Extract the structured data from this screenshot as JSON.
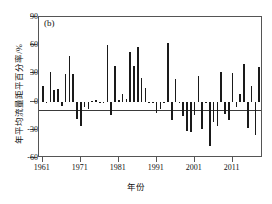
{
  "figure": {
    "panel_label": "(b)",
    "background": "#ffffff",
    "bar_color": "#1a1a1a",
    "axis_color": "#555555"
  },
  "chart_data": {
    "type": "bar",
    "title": "(b)",
    "xlabel": "年份",
    "ylabel": "年平均流量距平百分率/%",
    "ylim": [
      -60,
      90
    ],
    "xlim": [
      1960,
      2019
    ],
    "yticks": [
      90,
      60,
      30,
      0,
      -30,
      -60
    ],
    "ytick_labels": [
      "90",
      "60",
      "30",
      "0",
      "-30",
      "-60"
    ],
    "xticks": [
      1961,
      1971,
      1981,
      1991,
      2001,
      2011
    ],
    "xtick_labels": [
      "1961",
      "1971",
      "1981",
      "1991",
      "2001",
      "2011"
    ],
    "grid": false,
    "legend": null,
    "zero_reference_line": 0,
    "x": [
      1961,
      1962,
      1963,
      1964,
      1965,
      1966,
      1967,
      1968,
      1969,
      1970,
      1971,
      1972,
      1973,
      1974,
      1975,
      1976,
      1977,
      1978,
      1979,
      1980,
      1981,
      1982,
      1983,
      1984,
      1985,
      1986,
      1987,
      1988,
      1989,
      1990,
      1991,
      1992,
      1993,
      1994,
      1995,
      1996,
      1997,
      1998,
      1999,
      2000,
      2001,
      2002,
      2003,
      2004,
      2005,
      2006,
      2007,
      2008,
      2009,
      2010,
      2011,
      2012,
      2013,
      2014,
      2015,
      2016,
      2017,
      2018
    ],
    "values": [
      17,
      -1,
      32,
      12,
      13,
      -5,
      29,
      48,
      29,
      -18,
      -26,
      -6,
      -8,
      1,
      2,
      -2,
      -1,
      60,
      -14,
      38,
      2,
      8,
      3,
      53,
      38,
      58,
      25,
      14,
      -2,
      -1,
      -12,
      -8,
      -1,
      62,
      -20,
      24,
      -1,
      -15,
      -31,
      -32,
      -14,
      27,
      -29,
      -1,
      -47,
      -22,
      -26,
      31,
      -13,
      -20,
      30,
      -6,
      8,
      40,
      -28,
      17,
      -36,
      37
    ],
    "series_name": "年平均流量距平百分率"
  }
}
